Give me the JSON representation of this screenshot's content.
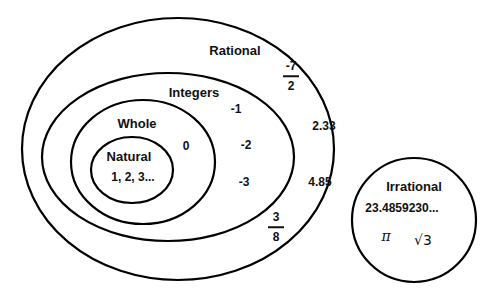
{
  "sets": {
    "rational": {
      "label": "Rational"
    },
    "integers": {
      "label": "Integers"
    },
    "whole": {
      "label": "Whole"
    },
    "natural": {
      "label": "Natural",
      "members": "1, 2, 3..."
    },
    "irrational": {
      "label": "Irrational"
    }
  },
  "members": {
    "whole_only": [
      "0"
    ],
    "integers_only": [
      "-1",
      "-2",
      "-3"
    ],
    "rational_only": [
      "2.33",
      "4.85"
    ],
    "rational_fractions": [
      {
        "numerator": "-7",
        "denominator": "2"
      },
      {
        "numerator": "3",
        "denominator": "8"
      }
    ],
    "irrational": {
      "decimal": "23.4859230...",
      "pi": "π",
      "sqrt": "√3"
    }
  },
  "style": {
    "stroke": "#000000",
    "background": "#ffffff"
  }
}
